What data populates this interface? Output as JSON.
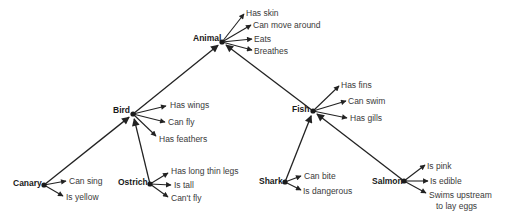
{
  "diagram": {
    "type": "semantic-network",
    "colors": {
      "line": "#222222",
      "text": "#3a3a3a",
      "node_text": "#1a1a1a",
      "background": "#ffffff"
    },
    "nodes": [
      {
        "id": "animal",
        "label": "Animal",
        "x": 222,
        "y": 42,
        "label_x": 193,
        "label_y": 41,
        "properties": [
          {
            "text": "Has skin",
            "tx": 246,
            "ty": 16,
            "ax": 244,
            "ay": 14
          },
          {
            "text": "Can move around",
            "tx": 253,
            "ty": 28,
            "ax": 251,
            "ay": 25
          },
          {
            "text": "Eats",
            "tx": 254,
            "ty": 42,
            "ax": 252,
            "ay": 39
          },
          {
            "text": "Breathes",
            "tx": 254,
            "ty": 54,
            "ax": 252,
            "ay": 50
          }
        ]
      },
      {
        "id": "bird",
        "label": "Bird",
        "x": 133,
        "y": 114,
        "label_x": 113,
        "label_y": 113,
        "properties": [
          {
            "text": "Has wings",
            "tx": 170,
            "ty": 108,
            "ax": 166,
            "ay": 106
          },
          {
            "text": "Can fly",
            "tx": 168,
            "ty": 125,
            "ax": 165,
            "ay": 122
          },
          {
            "text": "Has feathers",
            "tx": 159,
            "ty": 142,
            "ax": 156,
            "ay": 136
          }
        ]
      },
      {
        "id": "fish",
        "label": "Fish",
        "x": 313,
        "y": 111,
        "label_x": 292,
        "label_y": 112,
        "properties": [
          {
            "text": "Has fins",
            "tx": 341,
            "ty": 88,
            "ax": 339,
            "ay": 86
          },
          {
            "text": "Can swim",
            "tx": 348,
            "ty": 104,
            "ax": 346,
            "ay": 101
          },
          {
            "text": "Has gills",
            "tx": 350,
            "ty": 121,
            "ax": 347,
            "ay": 118
          }
        ]
      },
      {
        "id": "canary",
        "label": "Canary",
        "x": 44,
        "y": 185,
        "label_x": 13,
        "label_y": 186,
        "properties": [
          {
            "text": "Can sing",
            "tx": 69,
            "ty": 184,
            "ax": 66,
            "ay": 181
          },
          {
            "text": "Is yellow",
            "tx": 66,
            "ty": 200,
            "ax": 63,
            "ay": 196
          }
        ]
      },
      {
        "id": "ostrich",
        "label": "Ostrich",
        "x": 150,
        "y": 184,
        "label_x": 118,
        "label_y": 185,
        "properties": [
          {
            "text": "Has long thin legs",
            "tx": 171,
            "ty": 174,
            "ax": 168,
            "ay": 173
          },
          {
            "text": "Is tall",
            "tx": 174,
            "ty": 188,
            "ax": 171,
            "ay": 185
          },
          {
            "text": "Can't fly",
            "tx": 171,
            "ty": 201,
            "ax": 168,
            "ay": 197
          }
        ]
      },
      {
        "id": "shark",
        "label": "Shark",
        "x": 285,
        "y": 182,
        "label_x": 259,
        "label_y": 184,
        "properties": [
          {
            "text": "Can bite",
            "tx": 304,
            "ty": 179,
            "ax": 301,
            "ay": 176
          },
          {
            "text": "Is dangerous",
            "tx": 303,
            "ty": 194,
            "ax": 301,
            "ay": 190
          }
        ]
      },
      {
        "id": "salmon",
        "label": "Salmon",
        "x": 404,
        "y": 181,
        "label_x": 372,
        "label_y": 184,
        "properties": [
          {
            "text": "Is pink",
            "tx": 427,
            "ty": 169,
            "ax": 425,
            "ay": 165
          },
          {
            "text": "Is edible",
            "tx": 430,
            "ty": 184,
            "ax": 428,
            "ay": 181
          },
          {
            "text": "Swims upstream",
            "tx": 429,
            "ty": 198,
            "ax": 426,
            "ay": 193
          },
          {
            "text": "to lay eggs",
            "tx": 436,
            "ty": 209,
            "ax": null,
            "ay": null
          }
        ]
      }
    ],
    "edges": [
      {
        "from": "bird",
        "to": "animal"
      },
      {
        "from": "fish",
        "to": "animal"
      },
      {
        "from": "canary",
        "to": "bird"
      },
      {
        "from": "ostrich",
        "to": "bird"
      },
      {
        "from": "shark",
        "to": "fish"
      },
      {
        "from": "salmon",
        "to": "fish"
      }
    ]
  }
}
